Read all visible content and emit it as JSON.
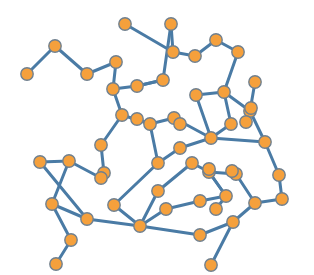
{
  "figure": {
    "type": "node-link-network-graph",
    "width": 314,
    "height": 275,
    "background_color": "#ffffff",
    "node_fill_color": "#F5A03C",
    "node_stroke_color": "#70808F",
    "edge_color": "#4A7BA5",
    "node_radius": 6.2,
    "edge_width": 3.0
  },
  "chart_data": {
    "type": "scatter",
    "title": "",
    "subtitle": "",
    "xlabel": "",
    "ylabel": "",
    "grid": false,
    "legend": "none",
    "xlim": [
      0,
      314
    ],
    "ylim": [
      0,
      275
    ],
    "node_count": 56,
    "edge_count": 62,
    "nodes": [
      {
        "id": 0,
        "x": 27,
        "y": 74
      },
      {
        "id": 1,
        "x": 55,
        "y": 46
      },
      {
        "id": 2,
        "x": 87,
        "y": 74
      },
      {
        "id": 3,
        "x": 116,
        "y": 62
      },
      {
        "id": 4,
        "x": 113,
        "y": 89
      },
      {
        "id": 5,
        "x": 125,
        "y": 24
      },
      {
        "id": 6,
        "x": 171,
        "y": 24
      },
      {
        "id": 7,
        "x": 173,
        "y": 52
      },
      {
        "id": 8,
        "x": 195,
        "y": 56
      },
      {
        "id": 9,
        "x": 216,
        "y": 40
      },
      {
        "id": 10,
        "x": 238,
        "y": 52
      },
      {
        "id": 11,
        "x": 163,
        "y": 80
      },
      {
        "id": 12,
        "x": 137,
        "y": 86
      },
      {
        "id": 13,
        "x": 122,
        "y": 115
      },
      {
        "id": 14,
        "x": 150,
        "y": 124
      },
      {
        "id": 15,
        "x": 174,
        "y": 118
      },
      {
        "id": 16,
        "x": 196,
        "y": 95
      },
      {
        "id": 17,
        "x": 224,
        "y": 92
      },
      {
        "id": 18,
        "x": 255,
        "y": 82
      },
      {
        "id": 19,
        "x": 250,
        "y": 111
      },
      {
        "id": 20,
        "x": 231,
        "y": 124
      },
      {
        "id": 21,
        "x": 211,
        "y": 138
      },
      {
        "id": 22,
        "x": 265,
        "y": 142
      },
      {
        "id": 23,
        "x": 101,
        "y": 145
      },
      {
        "id": 24,
        "x": 104,
        "y": 173
      },
      {
        "id": 25,
        "x": 180,
        "y": 148
      },
      {
        "id": 26,
        "x": 158,
        "y": 163
      },
      {
        "id": 27,
        "x": 209,
        "y": 172
      },
      {
        "id": 28,
        "x": 279,
        "y": 175
      },
      {
        "id": 29,
        "x": 40,
        "y": 162
      },
      {
        "id": 30,
        "x": 69,
        "y": 161
      },
      {
        "id": 31,
        "x": 52,
        "y": 204
      },
      {
        "id": 32,
        "x": 87,
        "y": 219
      },
      {
        "id": 33,
        "x": 71,
        "y": 240
      },
      {
        "id": 34,
        "x": 56,
        "y": 264
      },
      {
        "id": 35,
        "x": 114,
        "y": 205
      },
      {
        "id": 36,
        "x": 140,
        "y": 226
      },
      {
        "id": 37,
        "x": 166,
        "y": 209
      },
      {
        "id": 38,
        "x": 200,
        "y": 201
      },
      {
        "id": 39,
        "x": 226,
        "y": 196
      },
      {
        "id": 40,
        "x": 200,
        "y": 235
      },
      {
        "id": 41,
        "x": 211,
        "y": 265
      },
      {
        "id": 42,
        "x": 233,
        "y": 222
      },
      {
        "id": 43,
        "x": 255,
        "y": 203
      },
      {
        "id": 44,
        "x": 282,
        "y": 199
      },
      {
        "id": 45,
        "x": 236,
        "y": 174
      },
      {
        "id": 46,
        "x": 192,
        "y": 163
      },
      {
        "id": 47,
        "x": 158,
        "y": 191
      },
      {
        "id": 48,
        "x": 101,
        "y": 178
      },
      {
        "id": 49,
        "x": 209,
        "y": 169
      },
      {
        "id": 50,
        "x": 251,
        "y": 108
      },
      {
        "id": 51,
        "x": 246,
        "y": 122
      },
      {
        "id": 52,
        "x": 180,
        "y": 124
      },
      {
        "id": 53,
        "x": 232,
        "y": 171
      },
      {
        "id": 54,
        "x": 137,
        "y": 119
      },
      {
        "id": 55,
        "x": 216,
        "y": 209
      }
    ],
    "edges": [
      [
        0,
        1
      ],
      [
        1,
        2
      ],
      [
        2,
        3
      ],
      [
        3,
        4
      ],
      [
        4,
        13
      ],
      [
        5,
        7
      ],
      [
        6,
        7
      ],
      [
        6,
        11
      ],
      [
        7,
        8
      ],
      [
        8,
        9
      ],
      [
        9,
        10
      ],
      [
        10,
        17
      ],
      [
        11,
        12
      ],
      [
        12,
        4
      ],
      [
        13,
        14
      ],
      [
        13,
        23
      ],
      [
        14,
        15
      ],
      [
        15,
        21
      ],
      [
        16,
        17
      ],
      [
        16,
        21
      ],
      [
        17,
        19
      ],
      [
        18,
        19
      ],
      [
        19,
        22
      ],
      [
        20,
        21
      ],
      [
        21,
        22
      ],
      [
        22,
        28
      ],
      [
        23,
        24
      ],
      [
        24,
        48
      ],
      [
        25,
        26
      ],
      [
        25,
        21
      ],
      [
        26,
        35
      ],
      [
        27,
        39
      ],
      [
        29,
        32
      ],
      [
        30,
        31
      ],
      [
        30,
        48
      ],
      [
        31,
        33
      ],
      [
        32,
        36
      ],
      [
        33,
        34
      ],
      [
        35,
        36
      ],
      [
        36,
        37
      ],
      [
        36,
        40
      ],
      [
        37,
        38
      ],
      [
        38,
        39
      ],
      [
        39,
        27
      ],
      [
        40,
        42
      ],
      [
        41,
        42
      ],
      [
        43,
        44
      ],
      [
        43,
        42
      ],
      [
        44,
        28
      ],
      [
        45,
        43
      ],
      [
        27,
        45
      ],
      [
        20,
        17
      ],
      [
        15,
        52
      ],
      [
        14,
        54
      ],
      [
        46,
        47
      ],
      [
        47,
        36
      ],
      [
        46,
        27
      ],
      [
        55,
        39
      ],
      [
        12,
        11
      ],
      [
        29,
        30
      ],
      [
        31,
        32
      ],
      [
        26,
        14
      ]
    ]
  }
}
